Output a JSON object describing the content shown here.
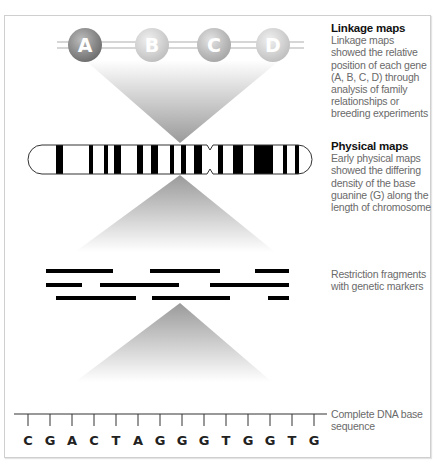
{
  "figure": {
    "stages": [
      {
        "id": "linkage",
        "title": "Linkage maps",
        "description": "Linkage maps showed the relative position of each gene (A, B, C, D) through analysis of family relationships or breeding experiments",
        "genes": [
          {
            "label": "A",
            "cx": 85,
            "shade": "dark"
          },
          {
            "label": "B",
            "cx": 152,
            "shade": "light"
          },
          {
            "label": "C",
            "cx": 214,
            "shade": "mid"
          },
          {
            "label": "D",
            "cx": 273,
            "shade": "light"
          }
        ]
      },
      {
        "id": "physical",
        "title": "Physical maps",
        "description": "Early physical maps showed the differing density of the base guanine (G) along the length of chromosome",
        "bands": [
          [
            56,
            63
          ],
          [
            89,
            93
          ],
          [
            104,
            108
          ],
          [
            114,
            121
          ],
          [
            137,
            143
          ],
          [
            151,
            158
          ],
          [
            170,
            174
          ],
          [
            181,
            186
          ],
          [
            194,
            202
          ],
          [
            218,
            223
          ],
          [
            233,
            243
          ],
          [
            254,
            273
          ],
          [
            283,
            287
          ],
          [
            295,
            299
          ]
        ],
        "centromere_x": 210
      },
      {
        "id": "restriction",
        "title": "",
        "description": "Restriction fragments with genetic markers",
        "fragments": [
          {
            "row": 0,
            "x1": 46,
            "x2": 113
          },
          {
            "row": 0,
            "x1": 150,
            "x2": 220
          },
          {
            "row": 0,
            "x1": 255,
            "x2": 289
          },
          {
            "row": 1,
            "x1": 46,
            "x2": 82
          },
          {
            "row": 1,
            "x1": 100,
            "x2": 179
          },
          {
            "row": 1,
            "x1": 210,
            "x2": 289
          },
          {
            "row": 2,
            "x1": 56,
            "x2": 136
          },
          {
            "row": 2,
            "x1": 152,
            "x2": 230
          },
          {
            "row": 2,
            "x1": 268,
            "x2": 289
          }
        ]
      },
      {
        "id": "dna",
        "title": "",
        "description": "Complete DNA base sequence",
        "sequence": [
          "C",
          "G",
          "A",
          "C",
          "T",
          "A",
          "G",
          "G",
          "G",
          "T",
          "G",
          "G",
          "T",
          "G"
        ]
      }
    ],
    "colors": {
      "band": "#000000",
      "funnel_dark": "#9a9a9a",
      "funnel_light": "#ffffff",
      "caption_text": "#6a6a6a",
      "caption_title": "#111111"
    }
  }
}
